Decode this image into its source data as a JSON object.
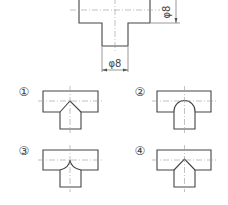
{
  "figure": {
    "main_view": {
      "description": "T-shaped pipe joint front view",
      "dimension_vertical": "φ8",
      "dimension_horizontal": "φ8"
    },
    "options": [
      {
        "label": "①",
        "intersection": "straight-lines-pointed-up"
      },
      {
        "label": "②",
        "intersection": "semicircle-arc"
      },
      {
        "label": "③",
        "intersection": "concave-arcs-cusp"
      },
      {
        "label": "④",
        "intersection": "straight-lines-pointed-up-short"
      }
    ]
  },
  "colors": {
    "line": "#444444",
    "centerline": "#999999",
    "background": "#ffffff"
  }
}
